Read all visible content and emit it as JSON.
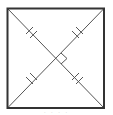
{
  "diagram": {
    "type": "square-with-diagonals",
    "square": {
      "x": 7,
      "y": 8,
      "width": 97,
      "height": 100,
      "stroke": "#333333",
      "stroke_width": 2
    },
    "diagonals": {
      "stroke": "#555555",
      "stroke_width": 1
    },
    "intersection": {
      "x": 56,
      "y": 58
    },
    "tick_marks": {
      "count_per_segment": 2,
      "segments": 4
    },
    "right_angle_marker": {
      "size": 7,
      "position": "right"
    }
  },
  "caption": {
    "text": "· · ·  ·"
  }
}
